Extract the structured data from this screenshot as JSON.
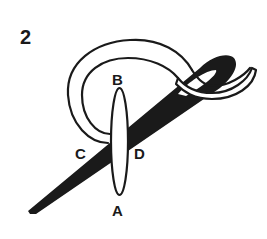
{
  "diagram": {
    "step_number": "2",
    "points": {
      "A": "A",
      "B": "B",
      "C": "C",
      "D": "D"
    },
    "elements": [
      "needle",
      "thread-loop",
      "oval-stitch"
    ],
    "colors": {
      "ink": "#1a1a1a",
      "background": "#ffffff"
    }
  }
}
